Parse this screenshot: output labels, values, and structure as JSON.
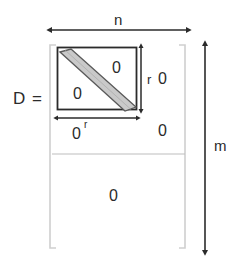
{
  "figure": {
    "title_label": "D =",
    "dimensions": {
      "width_label": "n",
      "height_label": "m",
      "block_height_label": "r",
      "block_width_label": "r"
    },
    "blocks": {
      "inner_zero_top_right": "0",
      "inner_zero_bottom_left": "0",
      "right_zero_top": "0",
      "right_zero_bottom": "0",
      "zero_below_inner_box": "0",
      "bottom_block_zero": "0"
    },
    "colors": {
      "stroke": "#2b2b2b",
      "band_fill": "#c9c9c9",
      "band_stroke": "#5a5a5a",
      "separator": "#bdbdbd",
      "bracket": "#cfcfcf",
      "background": "#ffffff"
    },
    "icons": {
      "width_arrow": "double-headed-horizontal-arrow",
      "height_arrow": "double-headed-vertical-arrow",
      "block_height_arrow": "double-headed-vertical-arrow",
      "block_width_arrow": "double-headed-horizontal-arrow",
      "diagonal_band": "diagonal-band-shape",
      "left_bracket": "left-matrix-bracket",
      "right_bracket": "right-matrix-bracket"
    }
  }
}
